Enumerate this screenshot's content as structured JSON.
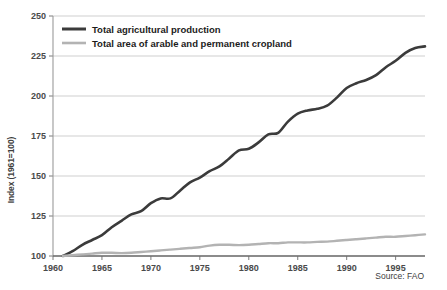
{
  "chart_data": {
    "type": "line",
    "title": "",
    "xlabel": "",
    "ylabel": "Index (1961=100)",
    "xlim": [
      1960,
      1998
    ],
    "ylim": [
      100,
      250
    ],
    "grid": true,
    "legend_position": "top-left",
    "xticks": [
      "1960",
      "1965",
      "1970",
      "1975",
      "1980",
      "1985",
      "1990",
      "1995"
    ],
    "xtick_values": [
      1960,
      1965,
      1970,
      1975,
      1980,
      1985,
      1990,
      1995
    ],
    "yticks": [
      "100",
      "125",
      "150",
      "175",
      "200",
      "225",
      "250"
    ],
    "ytick_values": [
      100,
      125,
      150,
      175,
      200,
      225,
      250
    ],
    "x": [
      1961,
      1962,
      1963,
      1964,
      1965,
      1966,
      1967,
      1968,
      1969,
      1970,
      1971,
      1972,
      1973,
      1974,
      1975,
      1976,
      1977,
      1978,
      1979,
      1980,
      1981,
      1982,
      1983,
      1984,
      1985,
      1986,
      1987,
      1988,
      1989,
      1990,
      1991,
      1992,
      1993,
      1994,
      1995,
      1996,
      1997,
      1998
    ],
    "series": [
      {
        "name": "Total agricultural production",
        "color": "#3b3b3b",
        "values": [
          100,
          103,
          107,
          110,
          113,
          118,
          122,
          126,
          128,
          133,
          136,
          136,
          141,
          146,
          149,
          153,
          156,
          161,
          166,
          167,
          171,
          176,
          177,
          184,
          189,
          191,
          192,
          194,
          199,
          205,
          208,
          210,
          213,
          218,
          222,
          227,
          230,
          231
        ]
      },
      {
        "name": "Total area of arable and permanent cropland",
        "color": "#b3b3b3",
        "values": [
          100,
          100.5,
          101,
          101.5,
          102,
          102,
          101.8,
          102,
          102.5,
          103,
          103.5,
          104,
          104.5,
          105,
          105.5,
          106.5,
          107,
          107,
          106.8,
          107,
          107.5,
          108,
          108,
          108.5,
          108.5,
          108.5,
          108.8,
          109,
          109.5,
          110,
          110.5,
          111,
          111.5,
          112,
          112,
          112.5,
          113,
          113.5
        ]
      }
    ]
  },
  "legend": {
    "items": [
      {
        "label": "Total agricultural production",
        "color": "#3b3b3b"
      },
      {
        "label": "Total area of arable and permanent cropland",
        "color": "#b3b3b3"
      }
    ]
  },
  "axis": {
    "ylabel": "Index (1961=100)"
  },
  "source": {
    "text": "Source: FAO"
  }
}
